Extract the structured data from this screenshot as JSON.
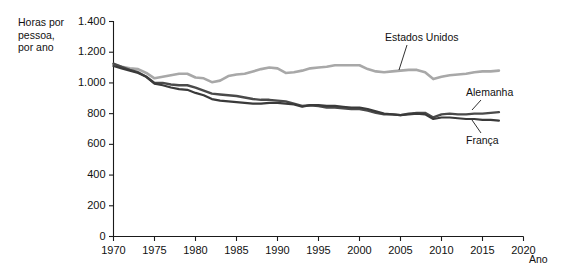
{
  "chart_data": {
    "type": "line",
    "title": "",
    "ylabel": "Horas por pessoa, por ano",
    "ylabel_lines": [
      "Horas por",
      "pessoa,",
      "por ano"
    ],
    "xlabel": "Ano",
    "xlim": [
      1970,
      2020
    ],
    "ylim": [
      0,
      1400
    ],
    "grid": false,
    "legend_position": "inline-annotations",
    "ytick_labels": [
      "0",
      "200",
      "400",
      "600",
      "800",
      "1.000",
      "1.200",
      "1.400"
    ],
    "ytick_values": [
      0,
      200,
      400,
      600,
      800,
      1000,
      1200,
      1400
    ],
    "xtick_labels": [
      "1970",
      "1975",
      "1980",
      "1985",
      "1990",
      "1995",
      "2000",
      "2005",
      "2010",
      "2015",
      "2020"
    ],
    "xtick_values": [
      1970,
      1975,
      1980,
      1985,
      1990,
      1995,
      2000,
      2005,
      2010,
      2015,
      2020
    ],
    "series": [
      {
        "name": "Estados Unidos",
        "color": "#a8a8a8",
        "x": [
          1970,
          1971,
          1972,
          1973,
          1974,
          1975,
          1976,
          1977,
          1978,
          1979,
          1980,
          1981,
          1982,
          1983,
          1984,
          1985,
          1986,
          1987,
          1988,
          1989,
          1990,
          1991,
          1992,
          1993,
          1994,
          1995,
          1996,
          1997,
          1998,
          1999,
          2000,
          2001,
          2002,
          2003,
          2004,
          2005,
          2006,
          2007,
          2008,
          2009,
          2010,
          2011,
          2012,
          2013,
          2014,
          2015,
          2016,
          2017
        ],
        "values": [
          1120,
          1105,
          1095,
          1090,
          1065,
          1030,
          1040,
          1050,
          1060,
          1060,
          1035,
          1030,
          1005,
          1015,
          1045,
          1055,
          1060,
          1075,
          1090,
          1100,
          1095,
          1065,
          1070,
          1080,
          1095,
          1100,
          1105,
          1115,
          1115,
          1115,
          1115,
          1090,
          1075,
          1070,
          1075,
          1080,
          1085,
          1085,
          1070,
          1025,
          1040,
          1050,
          1055,
          1060,
          1070,
          1075,
          1075,
          1080
        ]
      },
      {
        "name": "Alemanha",
        "color": "#4a4a4a",
        "x": [
          1970,
          1971,
          1972,
          1973,
          1974,
          1975,
          1976,
          1977,
          1978,
          1979,
          1980,
          1981,
          1982,
          1983,
          1984,
          1985,
          1986,
          1987,
          1988,
          1989,
          1990,
          1991,
          1992,
          1993,
          1994,
          1995,
          1996,
          1997,
          1998,
          1999,
          2000,
          2001,
          2002,
          2003,
          2004,
          2005,
          2006,
          2007,
          2008,
          2009,
          2010,
          2011,
          2012,
          2013,
          2014,
          2015,
          2016,
          2017
        ],
        "values": [
          1125,
          1105,
          1085,
          1070,
          1040,
          1000,
          1000,
          990,
          985,
          985,
          970,
          950,
          930,
          925,
          920,
          915,
          905,
          895,
          890,
          890,
          885,
          880,
          865,
          850,
          855,
          850,
          840,
          840,
          835,
          830,
          830,
          820,
          805,
          795,
          795,
          790,
          800,
          805,
          805,
          775,
          795,
          800,
          795,
          795,
          800,
          800,
          805,
          810
        ]
      },
      {
        "name": "França",
        "color": "#3a3a3a",
        "x": [
          1970,
          1971,
          1972,
          1973,
          1974,
          1975,
          1976,
          1977,
          1978,
          1979,
          1980,
          1981,
          1982,
          1983,
          1984,
          1985,
          1986,
          1987,
          1988,
          1989,
          1990,
          1991,
          1992,
          1993,
          1994,
          1995,
          1996,
          1997,
          1998,
          1999,
          2000,
          2001,
          2002,
          2003,
          2004,
          2005,
          2006,
          2007,
          2008,
          2009,
          2010,
          2011,
          2012,
          2013,
          2014,
          2015,
          2016,
          2017
        ],
        "values": [
          1110,
          1095,
          1080,
          1065,
          1040,
          995,
          985,
          970,
          960,
          955,
          935,
          920,
          895,
          885,
          880,
          875,
          870,
          865,
          865,
          870,
          870,
          865,
          860,
          845,
          855,
          855,
          850,
          850,
          845,
          840,
          840,
          830,
          815,
          800,
          795,
          790,
          795,
          800,
          795,
          765,
          775,
          775,
          770,
          765,
          765,
          760,
          760,
          755
        ]
      }
    ],
    "annotations": [
      {
        "text": "Estados Unidos",
        "series": "Estados Unidos"
      },
      {
        "text": "Alemanha",
        "series": "Alemanha"
      },
      {
        "text": "França",
        "series": "França"
      }
    ]
  }
}
